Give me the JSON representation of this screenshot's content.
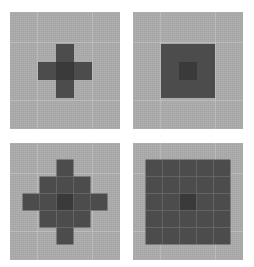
{
  "figure": {
    "background_color": "#ffffff",
    "panel_count": 4,
    "panel_background_color": "#a9a9a9",
    "kernel_on_color": "#4c4c4c",
    "kernel_center_color": "#3a3a3a",
    "layout": "2x2-grid"
  },
  "panels": [
    {
      "id": "top-left",
      "name": "cross-3x3",
      "shape": "plus",
      "grid_size": 3,
      "cell_px": 18,
      "matrix": [
        [
          0,
          1,
          0
        ],
        [
          1,
          2,
          1
        ],
        [
          0,
          1,
          0
        ]
      ]
    },
    {
      "id": "top-right",
      "name": "square-3x3",
      "shape": "square",
      "grid_size": 3,
      "cell_px": 18,
      "matrix": [
        [
          1,
          1,
          1
        ],
        [
          1,
          2,
          1
        ],
        [
          1,
          1,
          1
        ]
      ]
    },
    {
      "id": "bottom-left",
      "name": "diamond-5x5",
      "shape": "diamond",
      "grid_size": 5,
      "cell_px": 17,
      "matrix": [
        [
          0,
          0,
          1,
          0,
          0
        ],
        [
          0,
          1,
          1,
          1,
          0
        ],
        [
          1,
          1,
          2,
          1,
          1
        ],
        [
          0,
          1,
          1,
          1,
          0
        ],
        [
          0,
          0,
          1,
          0,
          0
        ]
      ]
    },
    {
      "id": "bottom-right",
      "name": "square-5x5",
      "shape": "square",
      "grid_size": 5,
      "cell_px": 17,
      "matrix": [
        [
          1,
          1,
          1,
          1,
          1
        ],
        [
          1,
          1,
          1,
          1,
          1
        ],
        [
          1,
          1,
          2,
          1,
          1
        ],
        [
          1,
          1,
          1,
          1,
          1
        ],
        [
          1,
          1,
          1,
          1,
          1
        ]
      ]
    }
  ]
}
